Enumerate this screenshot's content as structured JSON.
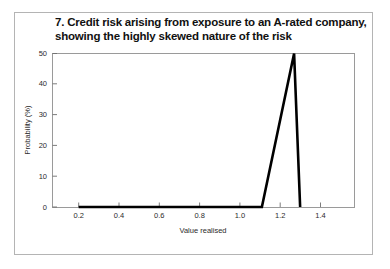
{
  "figure": {
    "background_color": "#ffffff",
    "frame_color": "#b4b4b4",
    "plot_frame_color": "#9a9a9a",
    "line_color": "#000000"
  },
  "chart_data": {
    "type": "line",
    "title_line_1": "7. Credit risk arising from exposure to an A-rated company,",
    "title_line_2": "showing the highly skewed nature of the risk",
    "title": "7. Credit risk arising from exposure to an A-rated company, showing the highly skewed nature of the risk",
    "xlabel": "Value realised",
    "ylabel": "Probability (%)",
    "xlim": [
      0.07,
      1.57
    ],
    "ylim": [
      0,
      50
    ],
    "xticks": [
      0.2,
      0.4,
      0.6,
      0.8,
      1.0,
      1.2,
      1.4
    ],
    "xtick_labels": [
      "0.2",
      "0.4",
      "0.6",
      "0.8",
      "1.0",
      "1.2",
      "1.4"
    ],
    "yticks": [
      0,
      10,
      20,
      30,
      40,
      50
    ],
    "ytick_labels": [
      "0",
      "10",
      "20",
      "30",
      "40",
      "50"
    ],
    "grid": false,
    "legend": false,
    "series": [
      {
        "name": "Probability density of value realised",
        "x": [
          0.2,
          0.4,
          0.6,
          0.8,
          1.0,
          1.11,
          1.27,
          1.3
        ],
        "values": [
          0,
          0,
          0,
          0,
          0,
          0,
          50,
          0
        ]
      }
    ],
    "annotations": []
  }
}
